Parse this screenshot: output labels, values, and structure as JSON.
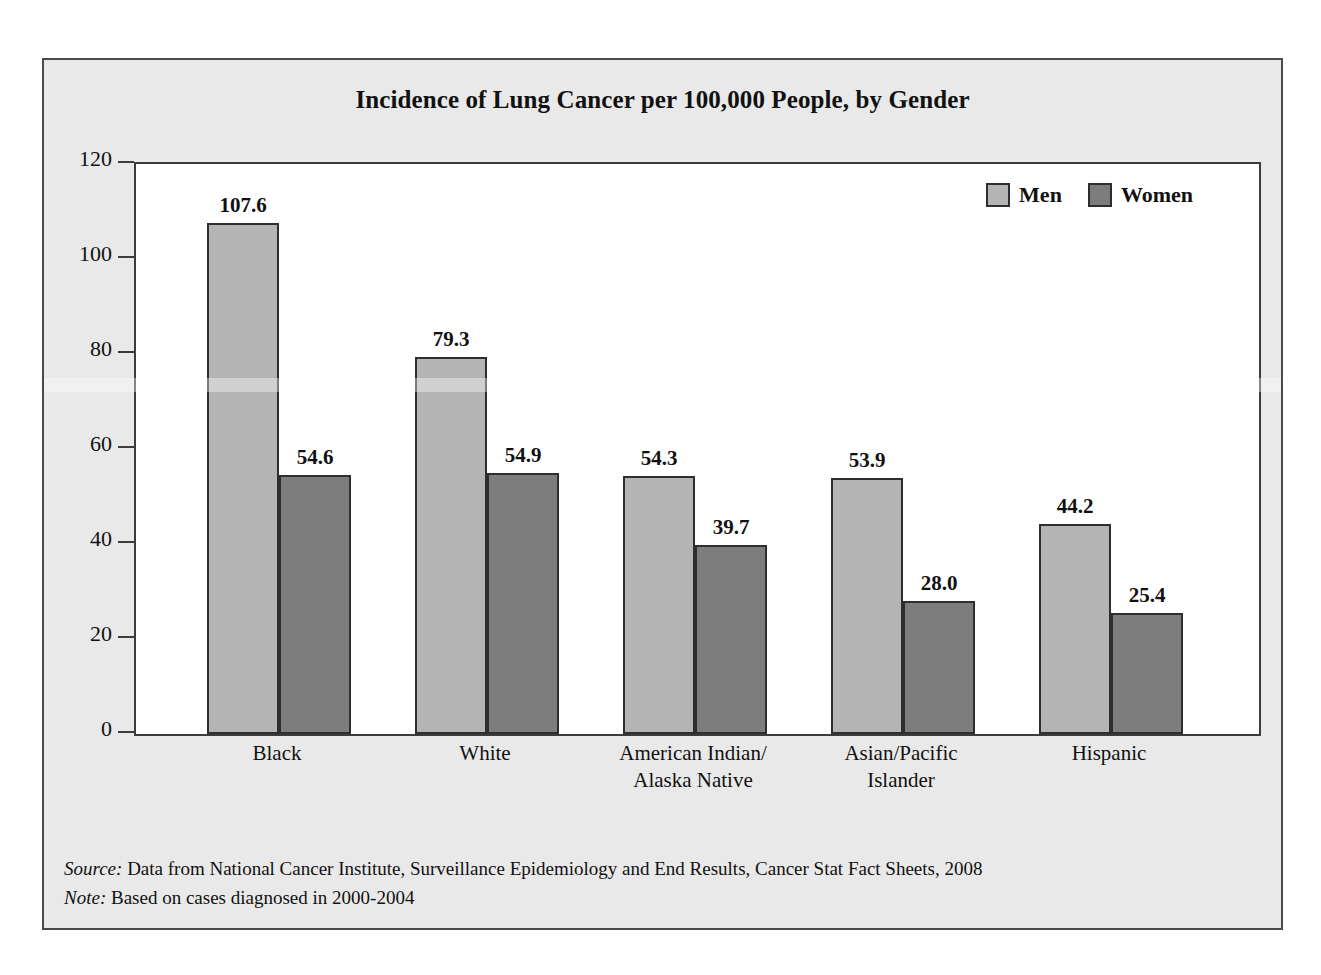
{
  "chart_data": {
    "type": "bar",
    "title": "Incidence of Lung Cancer per 100,000 People, by Gender",
    "xlabel": "",
    "ylabel": "",
    "ylim": [
      0,
      120
    ],
    "yticks": [
      0,
      20,
      40,
      60,
      80,
      100,
      120
    ],
    "grid": false,
    "legend_position": "top-right",
    "categories": [
      "Black",
      "White",
      "American Indian/\nAlaska Native",
      "Asian/Pacific\nIslander",
      "Hispanic"
    ],
    "series": [
      {
        "name": "Men",
        "color": "#b4b4b4",
        "values": [
          107.6,
          79.3,
          54.3,
          53.9,
          44.2
        ],
        "labels": [
          "107.6",
          "79.3",
          "54.3",
          "53.9",
          "44.2"
        ]
      },
      {
        "name": "Women",
        "color": "#7d7d7d",
        "values": [
          54.6,
          54.9,
          39.7,
          28.0,
          25.4
        ],
        "labels": [
          "54.6",
          "54.9",
          "39.7",
          "28.0",
          "25.4"
        ]
      }
    ],
    "ytick_labels": [
      "120",
      "100",
      "80",
      "60",
      "40",
      "20",
      "0"
    ]
  },
  "legend": {
    "entries": [
      {
        "label": "Men",
        "color": "#b4b4b4"
      },
      {
        "label": "Women",
        "color": "#7d7d7d"
      }
    ]
  },
  "footnotes": [
    {
      "label": "Source:",
      "text": " Data from National Cancer Institute, Surveillance Epidemiology and End Results, Cancer Stat Fact Sheets, 2008"
    },
    {
      "label": "Note:",
      "text": " Based on cases diagnosed in 2000-2004"
    }
  ],
  "colors": {
    "panel_background": "#e9e9e9",
    "plot_background": "#ffffff",
    "frame": "#4a4a4a",
    "axis": "#3c3c3c",
    "men_bar": "#b4b4b4",
    "women_bar": "#7d7d7d",
    "bar_outline": "#2e2e2e",
    "text": "#111111"
  }
}
